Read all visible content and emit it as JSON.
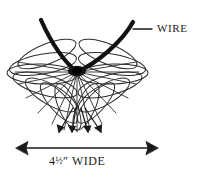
{
  "figure": {
    "type": "technical-line-illustration",
    "background_color": "#ffffff",
    "ink_color": "#1a1a1a",
    "loop_outline_color": "#2b2b2b",
    "wire_color": "#111111",
    "width_px": 203,
    "height_px": 178
  },
  "callout": {
    "wire_label": "WIRE",
    "leader_line": "leader-line"
  },
  "dimension": {
    "value": "4",
    "fraction": "½",
    "unit": "″",
    "word": "WIDE",
    "full_label": "4½″ WIDE",
    "orientation": "horizontal",
    "arrow_style": "double-headed"
  },
  "annotations": {
    "pointer_arrow_count": 4,
    "pointer_arrow_name": "loop-pointer-arrow",
    "loop_count": 14,
    "hub_name": "center-knot"
  }
}
